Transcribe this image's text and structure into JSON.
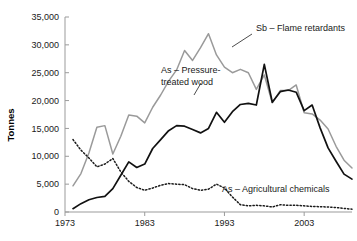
{
  "chart_data": {
    "type": "line",
    "title": "",
    "xlabel": "",
    "ylabel": "Tonnes",
    "xlim": [
      1973,
      2009
    ],
    "ylim": [
      0,
      35000
    ],
    "grid": false,
    "legend_position": "inline-annotations",
    "x_ticks": [
      "1973",
      "1983",
      "1993",
      "2003"
    ],
    "x_tick_values": [
      1973,
      1983,
      1993,
      2003
    ],
    "y_ticks": [
      "0",
      "5,000",
      "10,000",
      "15,000",
      "20,000",
      "25,000",
      "30,000",
      "35,000"
    ],
    "y_tick_values": [
      0,
      5000,
      10000,
      15000,
      20000,
      25000,
      30000,
      35000
    ],
    "x": [
      1974,
      1975,
      1976,
      1977,
      1978,
      1979,
      1980,
      1981,
      1982,
      1983,
      1984,
      1985,
      1986,
      1987,
      1988,
      1989,
      1990,
      1991,
      1992,
      1993,
      1994,
      1995,
      1996,
      1997,
      1998,
      1999,
      2000,
      2001,
      2002,
      2003,
      2004,
      2005,
      2006,
      2007,
      2008,
      2009
    ],
    "series": [
      {
        "name": "Sb – Flame retardants",
        "style": "solid",
        "color": "#9a9a9a",
        "values": [
          4700,
          6900,
          10600,
          15200,
          15500,
          10400,
          13600,
          17400,
          17200,
          16000,
          18800,
          21000,
          23500,
          25500,
          29000,
          27200,
          29500,
          32000,
          28200,
          26000,
          25000,
          25600,
          25000,
          22000,
          24600,
          19600,
          21800,
          21800,
          22800,
          17800,
          17600,
          16500,
          14900,
          11800,
          9300,
          7900
        ]
      },
      {
        "name": "As – Pressure-treated wood",
        "style": "solid",
        "color": "#111111",
        "values": [
          600,
          1500,
          2200,
          2600,
          2800,
          4200,
          6600,
          9000,
          8000,
          8600,
          11400,
          13000,
          14600,
          15500,
          15400,
          14800,
          14200,
          15000,
          17900,
          16100,
          18000,
          19300,
          19500,
          19200,
          26500,
          19700,
          21600,
          21900,
          21500,
          18200,
          19200,
          15100,
          11500,
          9100,
          6800,
          5900
        ]
      },
      {
        "name": "As – Agricultural chemicals",
        "style": "dotted",
        "color": "#1a1a1a",
        "values": [
          13000,
          11100,
          9700,
          8100,
          8600,
          9600,
          7200,
          5500,
          4400,
          3900,
          4300,
          4800,
          5100,
          5000,
          4900,
          4200,
          3900,
          4100,
          5000,
          4300,
          2700,
          1300,
          1100,
          1200,
          1100,
          900,
          1300,
          1200,
          1200,
          1100,
          1000,
          950,
          900,
          800,
          650,
          500
        ]
      }
    ],
    "annotations": [
      {
        "text": "Sb – Flame retardants",
        "lines": [
          "Sb – Flame retardants"
        ]
      },
      {
        "text": "As – Pressure-treated wood",
        "lines": [
          "As – Pressure-",
          "treated wood"
        ]
      },
      {
        "text": "As – Agricultural chemicals",
        "lines": [
          "As – Agricultural chemicals"
        ]
      }
    ]
  },
  "annotation_labels": {
    "sb_flame": "Sb – Flame retardants",
    "as_wood_line1": "As – Pressure-",
    "as_wood_line2": "treated wood",
    "as_agri": "As – Agricultural chemicals"
  },
  "axis": {
    "y_title": "Tonnes"
  }
}
